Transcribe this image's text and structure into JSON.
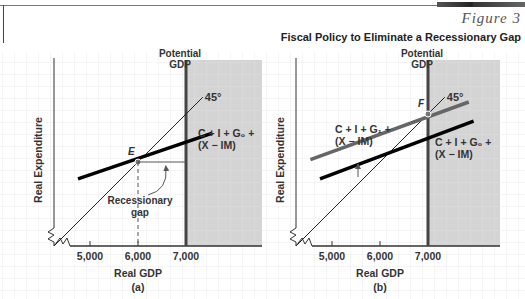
{
  "header": {
    "figure_label": "Figure 3",
    "figure_title": "Fiscal Policy to Eliminate a Recessionary Gap"
  },
  "colors": {
    "shade": "#d4d4d4",
    "grid": "#e6e6e6",
    "line_dark": "#000000",
    "line_gray": "#666666",
    "axis": "#333333"
  },
  "chart_data": [
    {
      "type": "line",
      "panel_label": "(a)",
      "xlabel": "Real GDP",
      "ylabel": "Real Expenditure",
      "x_ticks": [
        5000,
        6000,
        7000
      ],
      "x_tick_labels": [
        "5,000",
        "6,000",
        "7,000"
      ],
      "xlim": [
        4250,
        7500
      ],
      "ylim": [
        4250,
        7250
      ],
      "potential_gdp": {
        "x": 7000,
        "label_line1": "Potential",
        "label_line2": "GDP"
      },
      "shaded_region": {
        "from_x": 7000,
        "description": "inflationary region beyond potential GDP"
      },
      "series": [
        {
          "name": "45°",
          "label": "45°",
          "style": "thin",
          "points": [
            [
              4250,
              4250
            ],
            [
              7350,
              7350
            ]
          ]
        },
        {
          "name": "C + I + G0 + (X − IM)",
          "label_line1": "C + I + G₀ +",
          "label_line2": "(X − IM)",
          "style": "thick-black",
          "points": [
            [
              4750,
              5650
            ],
            [
              7550,
              6600
            ]
          ]
        }
      ],
      "equilibrium": {
        "label": "E",
        "x": 6000,
        "y": 6000
      },
      "annotations": [
        {
          "text_line1": "Recessionary",
          "text_line2": "gap",
          "between_x": [
            6000,
            7000
          ]
        }
      ]
    },
    {
      "type": "line",
      "panel_label": "(b)",
      "xlabel": "Real GDP",
      "ylabel": "Real Expenditure",
      "x_ticks": [
        5000,
        6000,
        7000
      ],
      "x_tick_labels": [
        "5,000",
        "6,000",
        "7,000"
      ],
      "xlim": [
        4250,
        7500
      ],
      "ylim": [
        4250,
        7250
      ],
      "potential_gdp": {
        "x": 7000,
        "label_line1": "Potential",
        "label_line2": "GDP"
      },
      "shaded_region": {
        "from_x": 7000,
        "description": "region beyond potential GDP"
      },
      "series": [
        {
          "name": "45°",
          "label": "45°",
          "style": "thin",
          "points": [
            [
              4250,
              4250
            ],
            [
              7350,
              7350
            ]
          ]
        },
        {
          "name": "C + I + G1 + (X − IM)",
          "label_line1": "C + I + G₁ +",
          "label_line2": "(X − IM)",
          "style": "thick-gray",
          "points": [
            [
              4550,
              6050
            ],
            [
              7850,
              7250
            ]
          ]
        },
        {
          "name": "C + I + G0 + (X − IM)",
          "label_line1": "C + I + G₀ +",
          "label_line2": "(X − IM)",
          "style": "thick-black",
          "points": [
            [
              4750,
              5650
            ],
            [
              7950,
              6850
            ]
          ]
        }
      ],
      "equilibrium": {
        "label": "F",
        "x": 7000,
        "y": 7000
      },
      "annotations": [
        {
          "text": "upward shift arrow",
          "from": "G0 line",
          "to": "G1 line"
        }
      ]
    }
  ]
}
